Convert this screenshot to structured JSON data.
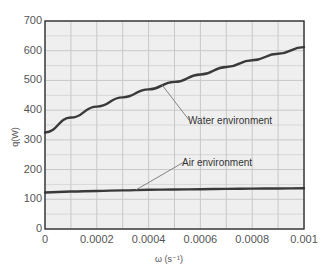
{
  "chart_data": {
    "type": "line",
    "title": "",
    "xlabel": "ω (s⁻¹)",
    "ylabel": "q(W)",
    "xlim": [
      0,
      0.001
    ],
    "ylim": [
      0,
      700
    ],
    "grid": true,
    "legend_position": "none (inline annotations)",
    "x_ticks": [
      "0",
      "0.0002",
      "0.0004",
      "0.0006",
      "0.0008",
      "0.001"
    ],
    "y_ticks": [
      "0",
      "100",
      "200",
      "300",
      "400",
      "500",
      "600",
      "700"
    ],
    "x_minor_gridlines": [
      0.0001,
      0.0003,
      0.0005,
      0.0007,
      0.0009
    ],
    "y_minor_gridlines": [
      50,
      150,
      250,
      350,
      450,
      550,
      650
    ],
    "x": [
      0,
      0.0001,
      0.0002,
      0.0003,
      0.0004,
      0.0005,
      0.0006,
      0.0007,
      0.0008,
      0.0009,
      0.001
    ],
    "series": [
      {
        "name": "Water environment",
        "values": [
          325,
          375,
          412,
          443,
          470,
          495,
          520,
          545,
          568,
          590,
          612
        ]
      },
      {
        "name": "Air environment",
        "values": [
          123,
          126,
          128,
          130,
          132,
          133,
          134,
          135,
          136,
          136.5,
          137
        ]
      }
    ],
    "annotations": [
      {
        "text": "Water environment",
        "points_to": {
          "x": 0.00045,
          "y": 487
        }
      },
      {
        "text": "Air environment",
        "points_to": {
          "x": 0.00035,
          "y": 131
        }
      }
    ]
  },
  "colors": {
    "plot_background": "#efefef",
    "grid": "#c8c8c8",
    "axis": "#333333",
    "series_line": "#3a3a3a",
    "leader_line": "#777777",
    "tick_text": "#555555"
  }
}
